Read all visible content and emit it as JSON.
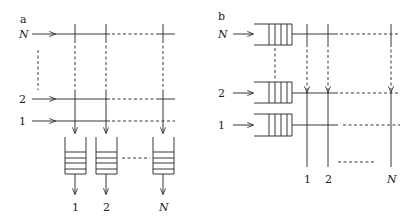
{
  "panels": [
    {
      "id": "a",
      "label": "a",
      "input_labels": [
        "N",
        "2",
        "1"
      ],
      "output_labels": [
        "1",
        "2",
        "N"
      ],
      "description": "Output-queued switch: inputs N..1 feed a crossbar, queues placed at each output"
    },
    {
      "id": "b",
      "label": "b",
      "input_labels": [
        "N",
        "2",
        "1"
      ],
      "output_labels": [
        "1",
        "2",
        "N"
      ],
      "description": "Input-queued switch: queues at each input before the crossbar"
    }
  ],
  "colors": {
    "stroke": "#222222",
    "background": "#ffffff"
  }
}
